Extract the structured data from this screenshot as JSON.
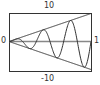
{
  "chart_data": {
    "type": "line",
    "title": "",
    "xlabel": "",
    "ylabel": "",
    "xlim": [
      0,
      1
    ],
    "ylim": [
      -10,
      10
    ],
    "tick_labels": {
      "ymax": "10",
      "ymin": "-10",
      "xmin": "0",
      "xmax": "1"
    },
    "grid": false,
    "series": [
      {
        "name": "y = 10x",
        "expr": "10*x"
      },
      {
        "name": "y = -10x",
        "expr": "-10*x"
      },
      {
        "name": "y = 10x sin(6πx)",
        "expr": "10*x*sin(6*pi*x)"
      }
    ],
    "colors": {
      "line": "#333333",
      "axis": "#888888",
      "frame": "#333333"
    }
  }
}
